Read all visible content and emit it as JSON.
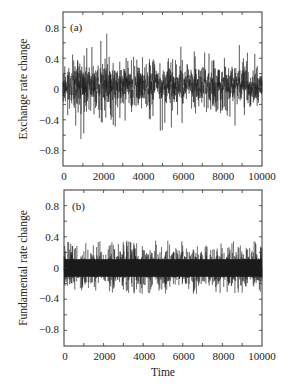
{
  "chart_data": [
    {
      "type": "line",
      "panel_label": "(a)",
      "title": "",
      "xlabel": "",
      "ylabel": "Exchange rate change",
      "xlim": [
        0,
        10000
      ],
      "ylim": [
        -1.0,
        1.0
      ],
      "xticks": [
        0,
        2000,
        4000,
        6000,
        8000,
        10000
      ],
      "xtick_labels": [
        "0",
        "2000",
        "4000",
        "6000",
        "8000",
        "10000"
      ],
      "yticks": [
        0.8,
        0.4,
        0,
        -0.4,
        -0.8
      ],
      "ytick_labels": [
        "0.8",
        "0.4",
        "0",
        "-0.4",
        "-0.8"
      ],
      "grid": false,
      "legend": null,
      "series": [
        {
          "name": "Exchange rate change",
          "description": "noisy time series, 10000 points, volatility clustering; typical range -0.4..0.5",
          "envelope_max": [
            0.45,
            0.4,
            0.55,
            0.7,
            0.45,
            0.4,
            0.5,
            0.6,
            0.55,
            0.5,
            0.6,
            0.55,
            0.45,
            0.55,
            0.6,
            0.5,
            0.55,
            0.6,
            0.65,
            0.55
          ],
          "envelope_min": [
            -0.45,
            -0.5,
            -0.65,
            -0.45,
            -0.4,
            -0.5,
            -0.45,
            -0.5,
            -0.5,
            -0.55,
            -0.5,
            -0.45,
            -0.4,
            -0.35,
            -0.35,
            -0.45,
            -0.4,
            -0.5,
            -0.35,
            -0.4
          ],
          "spike_max": {
            "x": 2200,
            "y": 0.72
          },
          "spike_min": {
            "x": 900,
            "y": -0.65
          }
        }
      ]
    },
    {
      "type": "line",
      "panel_label": "(b)",
      "title": "",
      "xlabel": "Time",
      "ylabel": "Fundamental rate change",
      "xlim": [
        0,
        10000
      ],
      "ylim": [
        -1.0,
        1.0
      ],
      "xticks": [
        0,
        2000,
        4000,
        6000,
        8000,
        10000
      ],
      "xtick_labels": [
        "0",
        "2000",
        "4000",
        "6000",
        "8000",
        "10000"
      ],
      "yticks": [
        0.8,
        0.4,
        0,
        -0.4,
        -0.8
      ],
      "ytick_labels": [
        "0.8",
        "0.4",
        "0",
        "-0.4",
        "-0.8"
      ],
      "grid": false,
      "legend": null,
      "series": [
        {
          "name": "Fundamental rate change",
          "description": "homoscedastic noise, 10000 points; dense band about +/-0.15, spikes to about +/-0.35",
          "band_half_width": 0.15,
          "spike_max": 0.35,
          "spike_min": -0.33
        }
      ]
    }
  ],
  "panels": {
    "a": {
      "tag": "(a)",
      "ylabel": "Exchange rate change",
      "yticks": [
        "0.8",
        "0.4",
        "0",
        "−0.4",
        "−0.8"
      ],
      "xticks": [
        "0",
        "2000",
        "4000",
        "6000",
        "8000",
        "10000"
      ]
    },
    "b": {
      "tag": "(b)",
      "ylabel": "Fundamental rate change",
      "yticks": [
        "0.8",
        "0.4",
        "0",
        "−0.4",
        "−0.8"
      ],
      "xticks": [
        "0",
        "2000",
        "4000",
        "6000",
        "8000",
        "10000"
      ],
      "xlabel": "Time"
    }
  },
  "colors": {
    "line": "#1a1a1a",
    "axis": "#333333",
    "background": "#ffffff"
  }
}
